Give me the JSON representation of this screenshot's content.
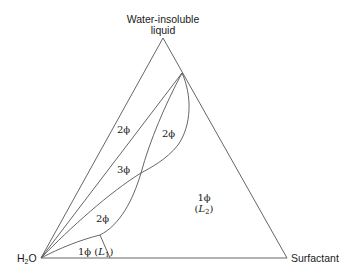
{
  "diagram": {
    "type": "ternary-phase-diagram",
    "vertices": {
      "top": {
        "line1": "Water-insoluble",
        "line2": "liquid"
      },
      "bottom_left": {
        "main": "H",
        "sub": "2",
        "tail": "O"
      },
      "bottom_right": "Surfactant"
    },
    "regions": {
      "left_two_phase": "2ϕ",
      "upper_two_phase": "2ϕ",
      "three_phase": "3ϕ",
      "lower_two_phase": "2ϕ",
      "one_phase_L1": {
        "phase": "1ϕ",
        "open": " (",
        "name": "L",
        "sub": "1",
        "close": ")"
      },
      "one_phase_L2": {
        "phase": "1ϕ",
        "open": "(",
        "name": "L",
        "sub": "2",
        "close": ")"
      }
    },
    "line_color": "#555555"
  }
}
